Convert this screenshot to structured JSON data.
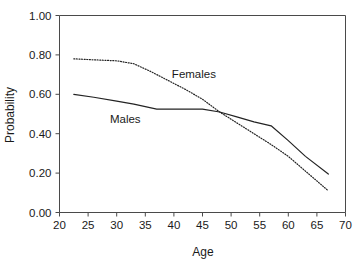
{
  "chart_data": {
    "type": "line",
    "title": "",
    "xlabel": "Age",
    "ylabel": "Probability",
    "xlim": [
      20,
      70
    ],
    "ylim": [
      0.0,
      1.0
    ],
    "grid": false,
    "legend_position": "inline-annotations",
    "x_ticks": [
      "20",
      "25",
      "30",
      "35",
      "40",
      "45",
      "50",
      "55",
      "60",
      "65",
      "70"
    ],
    "y_ticks": [
      "0.00",
      "0.20",
      "0.40",
      "0.60",
      "0.80",
      "1.00"
    ],
    "series": [
      {
        "name": "Females",
        "style": "dotted",
        "color": "#232323",
        "annotation": "Females",
        "x": [
          22.5,
          26,
          30,
          33,
          36,
          39,
          42,
          45,
          48,
          51,
          54,
          57,
          60,
          63,
          67
        ],
        "values": [
          0.78,
          0.775,
          0.77,
          0.755,
          0.715,
          0.67,
          0.625,
          0.575,
          0.51,
          0.455,
          0.4,
          0.345,
          0.285,
          0.21,
          0.11
        ]
      },
      {
        "name": "Males",
        "style": "solid",
        "color": "#232323",
        "annotation": "Males",
        "x": [
          22.5,
          26,
          30,
          33,
          37,
          41,
          45,
          48,
          51,
          54,
          57,
          60,
          63,
          67
        ],
        "values": [
          0.6,
          0.585,
          0.565,
          0.55,
          0.525,
          0.525,
          0.525,
          0.51,
          0.485,
          0.46,
          0.44,
          0.365,
          0.285,
          0.195
        ]
      }
    ],
    "annotations": [
      {
        "text": "Females",
        "x": 43.5,
        "y": 0.685
      },
      {
        "text": "Males",
        "x": 31.5,
        "y": 0.455
      }
    ]
  }
}
